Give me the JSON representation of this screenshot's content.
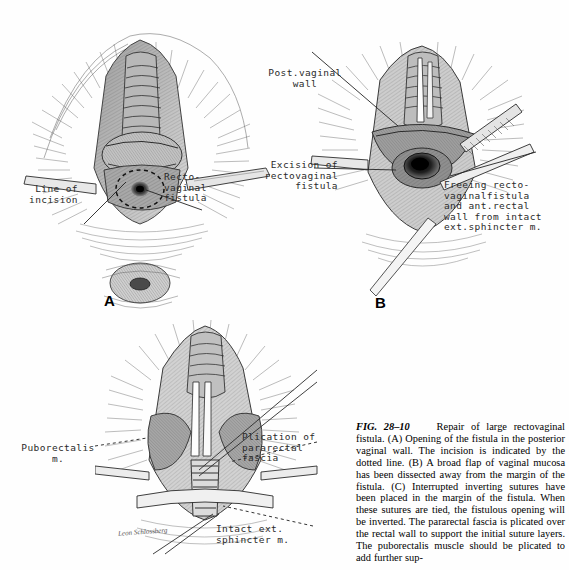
{
  "figure": {
    "panels": [
      {
        "letter": "A"
      },
      {
        "letter": "B"
      },
      {
        "letter": "C"
      }
    ],
    "labels": {
      "a_line_of_incision": "Line of\nincision",
      "a_rectovaginal_fistula": "Recto-\nvaginal\nfistula",
      "b_post_vaginal_wall": "Post.vaginal\nwall",
      "b_excision": "Excision of\nrectovaginal\nfistula",
      "b_freeing": "Freeing recto-\nvaginalfistula\nand ant.rectal\nwall from intact\next.sphincter m.",
      "c_puborectalis": "Puborectalis\nm.",
      "c_plication": "Plication of\npararectal\nfascia",
      "c_intact_sphincter": "Intact ext.\nsphincter m."
    },
    "artist_signature": "Leon Schlossberg"
  },
  "caption": {
    "fig_number": "FIG. 28–10",
    "title": "Repair of large rectovaginal fistula.",
    "body_a": "(A) Opening of the fistula in the posterior vaginal wall. The incision is indicated by the dotted line.",
    "body_b": "(B) A broad flap of vaginal mucosa has been dissected away from the margin of the fistula.",
    "body_c": "(C) Interrupted inverting sutures have been placed in the margin of the fistula. When these sutures are tied, the fistulous opening will be inverted. The pararectal fascia is plicated over the rectal wall to support the initial suture layers. The puborectalis muscle should be plicated to add further sup-",
    "full_text": "FIG. 28–10   Repair of large rectovaginal fistula. (A) Opening of the fistula in the posterior vaginal wall. The incision is indicated by the dotted line. (B) A broad flap of vaginal mucosa has been dissected away from the margin of the fistula. (C) Interrupted inverting sutures have been placed in the margin of the fistula. When these sutures are tied, the fistulous opening will be inverted. The pararectal fascia is plicated over the rectal wall to support the initial suture layers. The puborectalis muscle should be plicated to add further sup-"
  },
  "colors": {
    "ink": "#1a1a1a",
    "paper": "#ffffff",
    "label_ink": "#2a2a2a"
  }
}
